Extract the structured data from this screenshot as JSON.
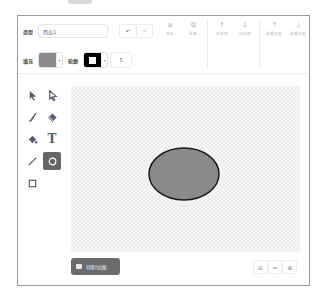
{
  "app": "Scratch paint editor",
  "row1": {
    "costume_label": "造型",
    "costume_name": "西瓜1",
    "undo_icon": "undo-icon",
    "redo_icon": "redo-icon",
    "buttons": [
      {
        "id": "group",
        "label": "组合",
        "icon": "group-icon"
      },
      {
        "id": "ungroup",
        "label": "拆散",
        "icon": "ungroup-icon"
      },
      {
        "id": "forward",
        "label": "往前放",
        "icon": "arrow-up-icon"
      },
      {
        "id": "backward",
        "label": "往后放",
        "icon": "arrow-down-icon"
      },
      {
        "id": "front",
        "label": "放最前面",
        "icon": "arrow-top-icon"
      },
      {
        "id": "back",
        "label": "放最后面",
        "icon": "arrow-bottom-icon"
      }
    ]
  },
  "row2": {
    "fill_label": "填充",
    "fill_color": "#8a8a8a",
    "outline_label": "轮廓",
    "outline_color": "#000000",
    "outline_width": "5"
  },
  "tools": [
    {
      "id": "select",
      "icon": "select-arrow-icon",
      "active": false
    },
    {
      "id": "reshape",
      "icon": "reshape-icon",
      "active": false
    },
    {
      "id": "brush",
      "icon": "brush-icon",
      "active": false
    },
    {
      "id": "eraser",
      "icon": "eraser-icon",
      "active": false
    },
    {
      "id": "fill",
      "icon": "fill-bucket-icon",
      "active": false
    },
    {
      "id": "text",
      "icon": "text-icon",
      "active": false,
      "glyph": "T"
    },
    {
      "id": "line",
      "icon": "line-icon",
      "active": false
    },
    {
      "id": "circle",
      "icon": "circle-icon",
      "active": true
    },
    {
      "id": "rectangle",
      "icon": "rectangle-icon",
      "active": false
    }
  ],
  "canvas": {
    "shape": "ellipse",
    "fill": "#8a8a8a",
    "stroke": "#1a1a1a"
  },
  "bottom": {
    "convert_label": "转换为位图",
    "zoom_out": "⊖",
    "zoom_reset": "=",
    "zoom_in": "⊕"
  }
}
